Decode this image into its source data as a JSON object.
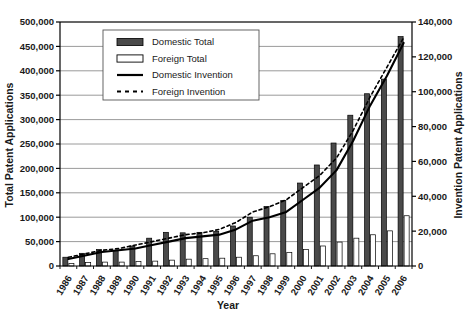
{
  "chart_data": {
    "type": "bar",
    "title": "",
    "xlabel": "Year",
    "ylabel": "Total Patent Applications",
    "y2label": "Invention Patent Applications",
    "grid": true,
    "legend_position": "top-left-inside",
    "categories": [
      "1986",
      "1987",
      "1988",
      "1989",
      "1990",
      "1991",
      "1992",
      "1993",
      "1994",
      "1995",
      "1996",
      "1997",
      "1998",
      "1999",
      "2000",
      "2001",
      "2002",
      "2003",
      "2004",
      "2005",
      "2006"
    ],
    "ylim": [
      0,
      500000
    ],
    "yticks": [
      0,
      50000,
      100000,
      150000,
      200000,
      250000,
      300000,
      350000,
      400000,
      450000,
      500000
    ],
    "ytick_labels": [
      "0",
      "50,000",
      "100,000",
      "150,000",
      "200,000",
      "250,000",
      "300,000",
      "350,000",
      "400,000",
      "450,000",
      "500,000"
    ],
    "y2lim": [
      0,
      140000
    ],
    "y2ticks": [
      0,
      20000,
      40000,
      60000,
      80000,
      100000,
      120000,
      140000
    ],
    "y2tick_labels": [
      "0",
      "20,000",
      "40,000",
      "60,000",
      "80,000",
      "100,000",
      "120,000",
      "140,000"
    ],
    "series": [
      {
        "name": "Domestic Total",
        "kind": "bar",
        "axis": "left",
        "color": "#4a4a4a",
        "edge": "#000000",
        "values": [
          18000,
          26000,
          34000,
          32000,
          41000,
          57000,
          69000,
          68000,
          69000,
          71000,
          82000,
          100000,
          122000,
          134000,
          170000,
          207000,
          252000,
          309000,
          353000,
          383000,
          470000
        ]
      },
      {
        "name": "Foreign Total",
        "kind": "bar",
        "axis": "left",
        "color": "#ffffff",
        "edge": "#000000",
        "values": [
          5000,
          7000,
          8000,
          8000,
          9000,
          10000,
          12000,
          14000,
          15000,
          16000,
          18000,
          21000,
          25000,
          28000,
          34000,
          41000,
          49000,
          57000,
          64000,
          72000,
          103000
        ]
      },
      {
        "name": "Domestic Invention",
        "kind": "line",
        "axis": "right",
        "color": "#000000",
        "dash": false,
        "values": [
          4000,
          6000,
          8000,
          9000,
          10000,
          12000,
          14000,
          16000,
          17000,
          18000,
          21000,
          26000,
          28000,
          31000,
          38000,
          45000,
          55000,
          72000,
          92000,
          109000,
          128000
        ]
      },
      {
        "name": "Foreign Invention",
        "kind": "line",
        "axis": "right",
        "color": "#000000",
        "dash": true,
        "values": [
          5000,
          7000,
          9000,
          10000,
          12000,
          14000,
          16000,
          18000,
          19000,
          21000,
          25000,
          31000,
          34000,
          38000,
          45000,
          52000,
          62000,
          78000,
          97000,
          114000,
          131000
        ]
      }
    ]
  },
  "axes": {
    "left_title": "Total Patent Applications",
    "right_title": "Invention Patent Applications",
    "x_title": "Year"
  },
  "legend": {
    "items": [
      {
        "label": "Domestic Total",
        "marker": "filled-bar-swatch"
      },
      {
        "label": "Foreign Total",
        "marker": "empty-bar-swatch"
      },
      {
        "label": "Domestic Invention",
        "marker": "solid-line-swatch"
      },
      {
        "label": "Foreign Invention",
        "marker": "dashed-line-swatch"
      }
    ]
  },
  "colors": {
    "domestic_bar": "#4a4a4a",
    "foreign_bar": "#ffffff",
    "line": "#000000",
    "grid": "#808080",
    "axis": "#000000",
    "background": "#ffffff"
  }
}
